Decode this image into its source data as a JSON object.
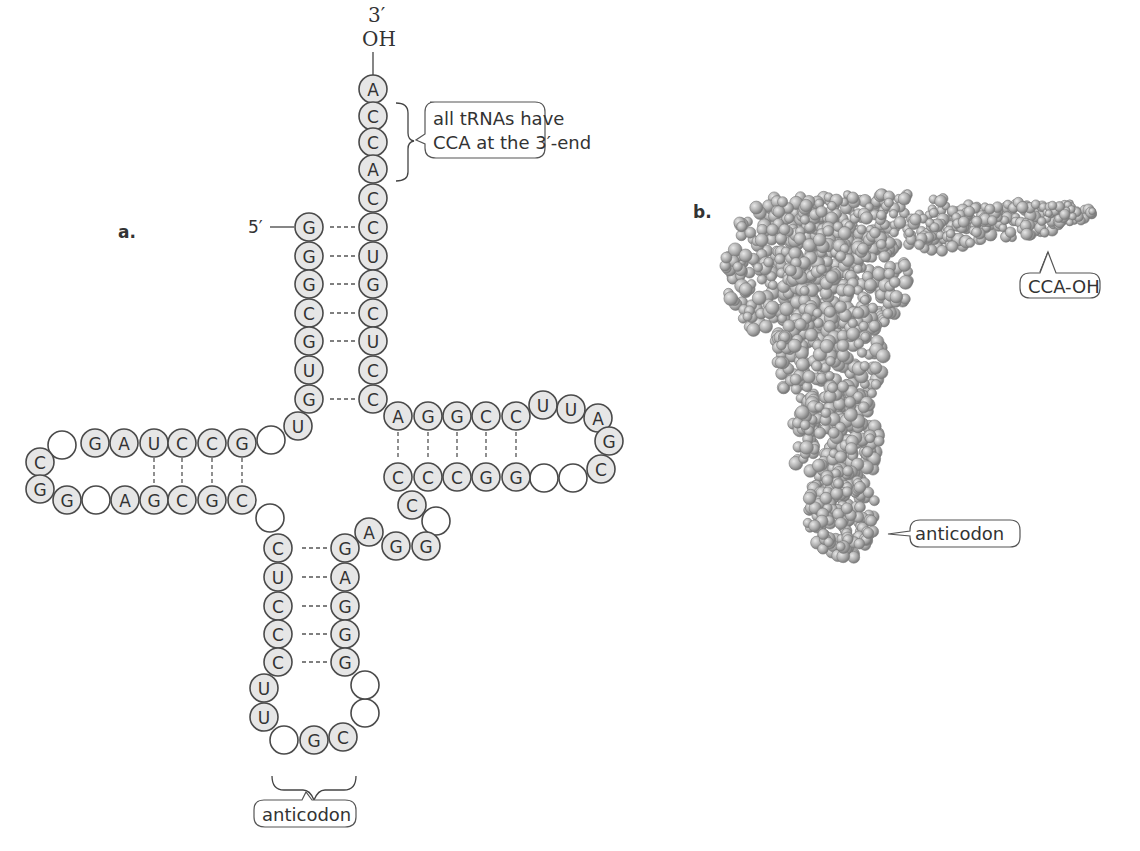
{
  "panel_a": {
    "label": "a.",
    "end_3_prime": "3′",
    "end_3_group": "OH",
    "end_5_prime": "5′",
    "cca_callout_line1": "all tRNAs have",
    "cca_callout_line2": "CCA at the 3′-end",
    "anticodon_label": "anticodon",
    "acceptor_stem_3_side": [
      "A",
      "C",
      "C",
      "A",
      "C",
      "C",
      "U",
      "G",
      "C",
      "U",
      "C"
    ],
    "acceptor_stem_5_side": [
      "G",
      "G",
      "G",
      "C",
      "G",
      "U",
      "G"
    ],
    "d_arm_top": [
      "",
      "G",
      "A",
      "U",
      "C",
      "C",
      "G",
      ""
    ],
    "d_arm_bottom": [
      "G",
      "",
      "A",
      "G",
      "C",
      "G",
      "C"
    ],
    "d_loop_end": [
      "C",
      "G"
    ],
    "t_arm_top": [
      "A",
      "G",
      "G",
      "C",
      "C"
    ],
    "t_loop": [
      "U",
      "U",
      "A",
      "G",
      "C"
    ],
    "t_arm_bottom": [
      "C",
      "C",
      "C",
      "G",
      "G"
    ],
    "variable_loop": [
      "C",
      "",
      "G",
      "G",
      "A"
    ],
    "anticodon_stem_left": [
      "C",
      "U",
      "C",
      "C",
      "C"
    ],
    "anticodon_stem_right": [
      "G",
      "A",
      "G",
      "G",
      "G"
    ],
    "anticodon_loop": [
      "U",
      "U",
      "",
      "G",
      "C",
      "",
      ""
    ],
    "connector_nt": "U"
  },
  "panel_b": {
    "label": "b.",
    "cca_label": "CCA-OH",
    "anticodon_label": "anticodon"
  },
  "colors": {
    "nucleotide_fill": "#e6e6e6",
    "nucleotide_stroke": "#4a4a4a",
    "atom_fill": "#b0b0b0"
  }
}
